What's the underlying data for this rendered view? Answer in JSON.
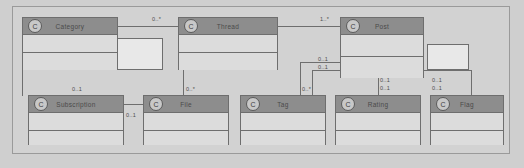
{
  "diagram": {
    "type": "uml-class-diagram",
    "title": "",
    "stereotype_glyph": "C",
    "colors": {
      "canvas": "#d2d2d2",
      "class_header": "#8d8d8d",
      "class_body": "#dcdcdc",
      "border": "#6e6e6e",
      "text": "#4a4a4a"
    }
  },
  "classes": [
    {
      "id": "category",
      "name": "Category",
      "stereotype": "C"
    },
    {
      "id": "thread",
      "name": "Thread",
      "stereotype": "C"
    },
    {
      "id": "post",
      "name": "Post",
      "stereotype": "C"
    },
    {
      "id": "subscription",
      "name": "Subscription",
      "stereotype": "C"
    },
    {
      "id": "file",
      "name": "File",
      "stereotype": "C"
    },
    {
      "id": "tag",
      "name": "Tag",
      "stereotype": "C"
    },
    {
      "id": "rating",
      "name": "Rating",
      "stereotype": "C"
    },
    {
      "id": "flag",
      "name": "Flag",
      "stereotype": "C"
    }
  ],
  "multiplicities": {
    "category_thread": "0..*",
    "thread_post": "1..*",
    "subscription_top": "0..1",
    "subscription_right": "0..1",
    "file": "0..*",
    "tag": "0..*",
    "post_left_a": "0..1",
    "post_left_b": "0..1",
    "post_bottom_a": "0..1",
    "post_right_a": "0..1",
    "post_right_b": "0..1",
    "rating": "0..1",
    "flag": "0..1"
  }
}
